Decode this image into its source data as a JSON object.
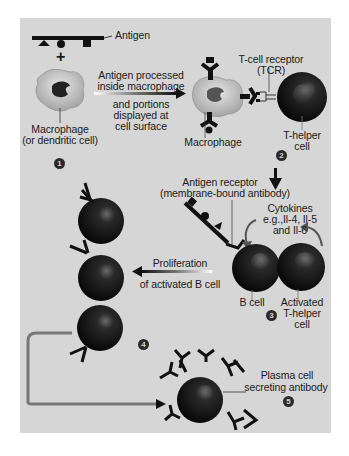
{
  "diagram": {
    "background_color": "#d6d6d6",
    "cell_color": "#111111",
    "macrophage_color": "#bdbdbd",
    "labels": {
      "antigen": "Antigen",
      "plus": "+",
      "process_line1": "Antigen processed",
      "process_line2": "inside macrophage",
      "display_line1": "and portions",
      "display_line2": "displayed at",
      "display_line3": "cell surface",
      "macrophage1_line1": "Macrophage",
      "macrophage1_line2": "(or dendritic cell)",
      "tcr_line1": "T-cell receptor",
      "tcr_line2": "(TCR)",
      "macrophage2": "Macrophage",
      "thelper_line1": "T-helper",
      "thelper_line2": "cell",
      "antigen_receptor_line1": "Antigen receptor",
      "antigen_receptor_line2": "(membrane-bound antibody)",
      "cytokines_line1": "Cytokines",
      "cytokines_line2": "e.g.,Il-4, Il-5",
      "cytokines_line3": "and Il-6",
      "proliferation_line1": "Proliferation",
      "proliferation_line2": "of activated B cell",
      "bcell": "B cell",
      "activated_line1": "Activated",
      "activated_line2": "T-helper",
      "activated_line3": "cell",
      "plasma_line1": "Plasma cell",
      "plasma_line2": "secreting antibody"
    },
    "steps": [
      "1",
      "2",
      "3",
      "4",
      "5"
    ]
  }
}
